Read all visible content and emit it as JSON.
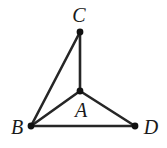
{
  "figure": {
    "kind": "geometry-diagram",
    "canvas": {
      "width": 167,
      "height": 148
    },
    "background_color": "#ffffff",
    "line_color": "#262626",
    "point_color": "#111111",
    "label_color": "#1a1a1a",
    "line_width": 2.6,
    "point_radius": 3.4,
    "points": [
      {
        "id": "A",
        "label": "A",
        "x": 80,
        "y": 91,
        "label_x": 81,
        "label_y": 110,
        "role": "interior-apex"
      },
      {
        "id": "B",
        "label": "B",
        "x": 31,
        "y": 126,
        "label_x": 17,
        "label_y": 127,
        "role": "base-left"
      },
      {
        "id": "C",
        "label": "C",
        "x": 80,
        "y": 32,
        "label_x": 79,
        "label_y": 15,
        "role": "top"
      },
      {
        "id": "D",
        "label": "D",
        "x": 135,
        "y": 126,
        "label_x": 151,
        "label_y": 127,
        "role": "base-right"
      }
    ],
    "edges": [
      {
        "id": "BC",
        "from": "B",
        "to": "C"
      },
      {
        "id": "CA",
        "from": "C",
        "to": "A"
      },
      {
        "id": "BA",
        "from": "B",
        "to": "A"
      },
      {
        "id": "AD",
        "from": "A",
        "to": "D"
      },
      {
        "id": "BD",
        "from": "B",
        "to": "D"
      }
    ]
  }
}
